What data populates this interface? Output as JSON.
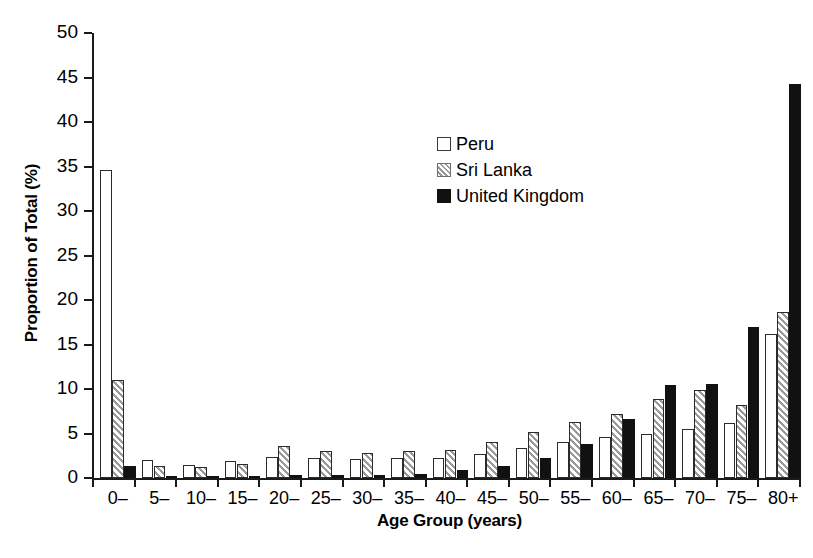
{
  "chart_data": {
    "type": "bar",
    "title": "",
    "xlabel": "Age Group (years)",
    "ylabel": "Proportion of Total (%)",
    "categories": [
      "0–",
      "5–",
      "10–",
      "15–",
      "20–",
      "25–",
      "30–",
      "35–",
      "40–",
      "45–",
      "50–",
      "55–",
      "60–",
      "65–",
      "70–",
      "75–",
      "80+"
    ],
    "series": [
      {
        "name": "Peru",
        "color": "#ffffff",
        "pattern": "open",
        "values": [
          34.6,
          2.0,
          1.5,
          1.9,
          2.4,
          2.2,
          2.1,
          2.2,
          2.2,
          2.7,
          3.4,
          4.0,
          4.6,
          5.0,
          5.5,
          6.2,
          16.2
        ]
      },
      {
        "name": "Sri Lanka",
        "color": "#9a9a9a",
        "pattern": "hatched",
        "values": [
          11.0,
          1.4,
          1.2,
          1.6,
          3.6,
          3.0,
          2.8,
          3.0,
          3.2,
          4.1,
          5.2,
          6.3,
          7.2,
          8.9,
          9.9,
          8.2,
          18.6
        ]
      },
      {
        "name": "United Kingdom",
        "color": "#111111",
        "pattern": "solid",
        "values": [
          1.3,
          0.2,
          0.1,
          0.2,
          0.3,
          0.3,
          0.35,
          0.5,
          0.9,
          1.3,
          2.3,
          3.8,
          6.6,
          10.5,
          10.6,
          17.0,
          44.3
        ]
      }
    ],
    "yticks": [
      0,
      5,
      10,
      15,
      20,
      25,
      30,
      35,
      40,
      45,
      50
    ],
    "ylim": [
      0,
      50
    ],
    "grid": false,
    "legend_position": "upper-center"
  },
  "legend": {
    "entries": [
      {
        "label": "Peru",
        "swatch": "open-square-icon"
      },
      {
        "label": "Sri Lanka",
        "swatch": "hatched-square-icon"
      },
      {
        "label": "United Kingdom",
        "swatch": "filled-square-icon"
      }
    ]
  }
}
